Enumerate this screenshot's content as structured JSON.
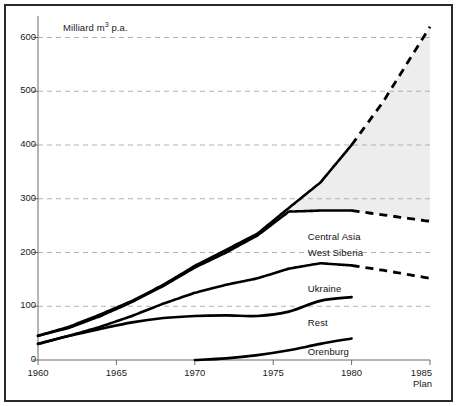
{
  "chart_data": {
    "type": "line",
    "title": "",
    "subtitle": "",
    "ylabel": "Milliard m³ p.a.",
    "ylabel_prefix": "Milliard m",
    "ylabel_sup": "3",
    "ylabel_suffix": " p.a.",
    "xlabel": "",
    "x_axis_note": "Plan",
    "xlim": [
      1960,
      1985
    ],
    "ylim": [
      0,
      640
    ],
    "yticks": [
      0,
      100,
      200,
      300,
      400,
      500,
      600
    ],
    "xticks": [
      1960,
      1965,
      1970,
      1975,
      1980,
      1985
    ],
    "ytick_labels": [
      "0",
      "100",
      "200",
      "300",
      "400",
      "500",
      "600"
    ],
    "xtick_labels": [
      "1960",
      "1965",
      "1970",
      "1975",
      "1980",
      "1985"
    ],
    "grid": "horizontal-dashed",
    "legend_position": "inline-labels",
    "forecast_start": 1980,
    "shaded_band": {
      "name": "West Siberia band",
      "color": "#ededed",
      "upper_series": "West Siberia",
      "lower_series": "Central Asia",
      "x_start": 1974,
      "x_end": 1985
    },
    "series": [
      {
        "name": "West Siberia",
        "label": "West Siberia",
        "style": "solid-then-dashed",
        "label_x": 1977.2,
        "label_y": 200,
        "x": [
          1960,
          1962,
          1964,
          1966,
          1968,
          1970,
          1972,
          1974,
          1976,
          1978,
          1980,
          1982,
          1985
        ],
        "y": [
          45,
          62,
          85,
          110,
          140,
          175,
          205,
          235,
          283,
          330,
          400,
          480,
          620
        ],
        "dashed_from": 1980
      },
      {
        "name": "Central Asia",
        "label": "Central Asia",
        "style": "solid-then-dashed",
        "label_x": 1977.2,
        "label_y": 228,
        "x": [
          1960,
          1962,
          1964,
          1966,
          1968,
          1970,
          1972,
          1974,
          1976,
          1978,
          1980,
          1982,
          1985
        ],
        "y": [
          45,
          60,
          82,
          108,
          138,
          172,
          200,
          232,
          276,
          278,
          278,
          270,
          258
        ],
        "dashed_from": 1980
      },
      {
        "name": "Ukraine",
        "label": "Ukraine",
        "style": "solid-then-dashed",
        "label_x": 1977.2,
        "label_y": 133,
        "x": [
          1960,
          1962,
          1964,
          1966,
          1968,
          1970,
          1972,
          1974,
          1976,
          1978,
          1980,
          1982,
          1985
        ],
        "y": [
          30,
          45,
          62,
          82,
          105,
          125,
          140,
          152,
          170,
          180,
          176,
          167,
          152
        ],
        "dashed_from": 1980
      },
      {
        "name": "Rest",
        "label": "Rest",
        "style": "solid",
        "label_x": 1977.2,
        "label_y": 68,
        "x": [
          1960,
          1962,
          1964,
          1966,
          1968,
          1970,
          1972,
          1974,
          1976,
          1978,
          1980
        ],
        "y": [
          30,
          45,
          58,
          70,
          78,
          82,
          83,
          82,
          90,
          110,
          117
        ],
        "dashed_from": null
      },
      {
        "name": "Orenburg",
        "label": "Orenburg",
        "style": "solid",
        "label_x": 1977.2,
        "label_y": 14,
        "x": [
          1970,
          1972,
          1974,
          1976,
          1978,
          1980
        ],
        "y": [
          0,
          3,
          9,
          18,
          30,
          40
        ],
        "dashed_from": null
      }
    ],
    "colors": {
      "line": "#000000",
      "grid": "#a8a8b8",
      "axis": "#6b6b6b",
      "band": "#ededed",
      "background": "#ffffff",
      "frame": "#2a2a2a"
    }
  }
}
